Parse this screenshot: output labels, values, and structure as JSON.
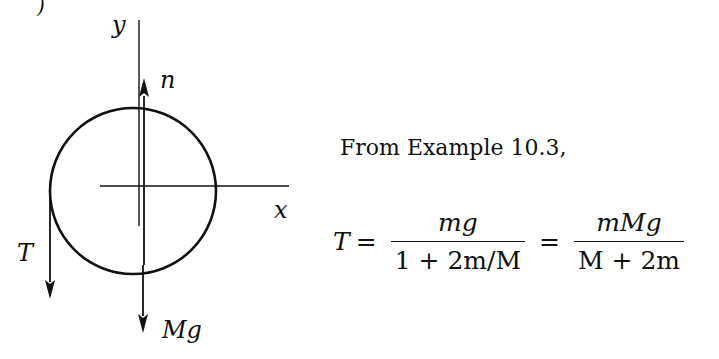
{
  "figure": {
    "axis_labels": {
      "y": "y",
      "x": "x"
    },
    "force_labels": {
      "normal": "n",
      "tension": "T",
      "weight": "Mg"
    },
    "circle": {
      "cx": 133,
      "cy": 191,
      "r": 83
    },
    "stroke_color": "#111111"
  },
  "text": {
    "intro": "From Example 10.3,",
    "partial_top_glyph": ")"
  },
  "equation": {
    "lhs": "T",
    "equals": "=",
    "frac1": {
      "num": "mg",
      "den": "1 + 2m/M"
    },
    "frac2": {
      "num": "mMg",
      "den": "M + 2m"
    }
  }
}
